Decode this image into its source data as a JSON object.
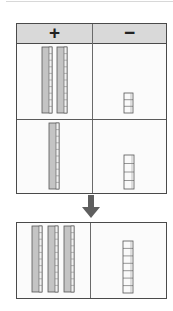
{
  "header": {
    "plus_label": "+",
    "minus_label": "−"
  },
  "top_table": {
    "rows": [
      {
        "positive_tens": 2,
        "negative_ones": 3
      },
      {
        "positive_tens": 1,
        "negative_ones": 4
      }
    ]
  },
  "result_table": {
    "positive_tens": 3,
    "negative_ones": 7
  },
  "icons": {
    "arrow": "arrow-down-icon",
    "ten_rod": "ten-rod-block-icon",
    "unit_rod": "unit-cube-stack-icon"
  },
  "colors": {
    "header_bg": "#d9d9d9",
    "rod_fill": "#c4c4c4",
    "border": "#4a4a4a",
    "arrow": "#5f5f5f"
  }
}
